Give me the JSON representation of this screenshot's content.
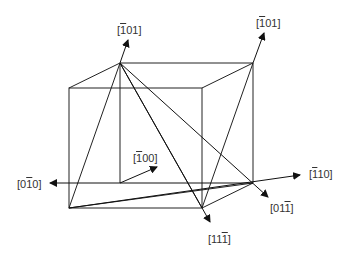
{
  "diagram": {
    "type": "crystal-directions-cube",
    "line_color": "#222222",
    "labels": [
      {
        "id": "m101_left",
        "parts": [
          "[",
          "1",
          "01]"
        ],
        "overline_index": 1,
        "x": 117,
        "y": 24
      },
      {
        "id": "m101_right",
        "parts": [
          "[",
          "1",
          "01]"
        ],
        "overline_index": 1,
        "x": 256,
        "y": 17
      },
      {
        "id": "m100",
        "parts": [
          "[",
          "1",
          "00]"
        ],
        "overline_index": 1,
        "x": 133,
        "y": 152
      },
      {
        "id": "0m10",
        "parts": [
          "[0",
          "1",
          "0]"
        ],
        "overline_index": 1,
        "x": 17,
        "y": 178
      },
      {
        "id": "m110",
        "parts": [
          "[",
          "1",
          "10]"
        ],
        "overline_index": 1,
        "x": 309,
        "y": 168
      },
      {
        "id": "01m1",
        "parts": [
          "[01",
          "1",
          "]"
        ],
        "overline_index": 1,
        "x": 270,
        "y": 202
      },
      {
        "id": "11m1",
        "parts": [
          "[11",
          "1",
          "]"
        ],
        "overline_index": 1,
        "x": 208,
        "y": 233
      }
    ]
  }
}
